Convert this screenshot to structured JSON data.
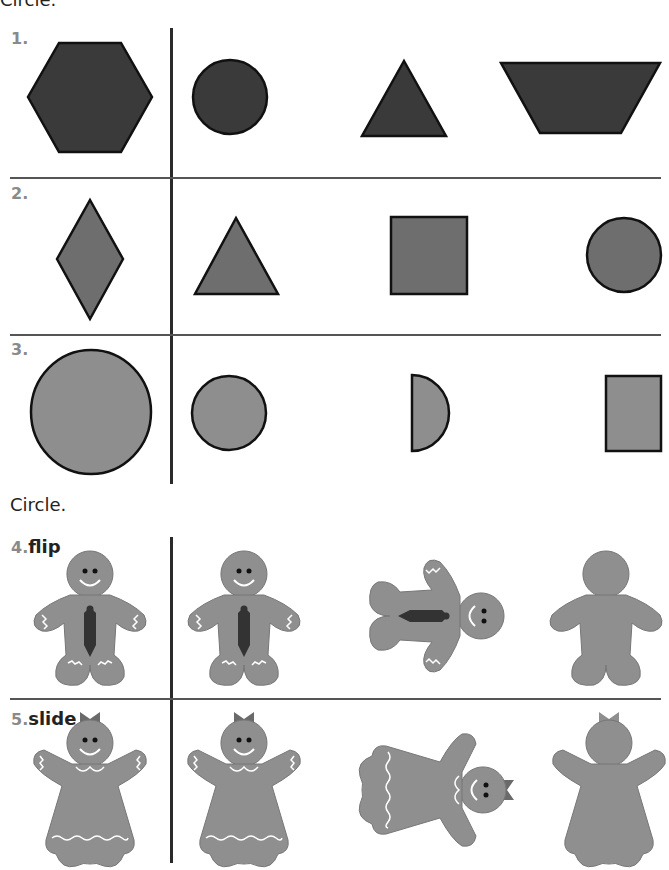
{
  "instructions": {
    "top": "Circle.",
    "middle": "Circle."
  },
  "problems": [
    {
      "number": "1.",
      "label": "",
      "target": "hexagon",
      "choices": [
        "circle",
        "triangle",
        "trapezoid"
      ],
      "fill": "#3a3a3a"
    },
    {
      "number": "2.",
      "label": "",
      "target": "rhombus",
      "choices": [
        "triangle",
        "square",
        "circle"
      ],
      "fill": "#6e6e6e"
    },
    {
      "number": "3.",
      "label": "",
      "target": "large circle",
      "choices": [
        "small circle",
        "half circle",
        "rectangle"
      ],
      "fill": "#8e8e8e"
    },
    {
      "number": "4.",
      "label": "flip",
      "target": "gingerbread boy with tie",
      "choices": [
        "gingerbread boy (same)",
        "gingerbread boy (turned)",
        "gingerbread boy silhouette"
      ]
    },
    {
      "number": "5.",
      "label": "slide",
      "target": "gingerbread girl with bow",
      "choices": [
        "gingerbread girl (same)",
        "gingerbread girl (turned)",
        "gingerbread girl silhouette"
      ]
    }
  ],
  "colors": {
    "row1_fill": "#3a3a3a",
    "row2_fill": "#6e6e6e",
    "row3_fill": "#8e8e8e",
    "cookie": "#8f8f8f",
    "tie": "#333333",
    "bow": "#6a6a6a",
    "number": "#8a8a8a"
  }
}
